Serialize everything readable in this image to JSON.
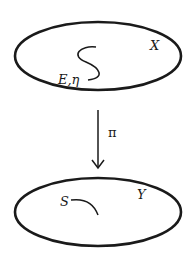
{
  "diagram": {
    "top_space": {
      "label": "X",
      "curve_label": "E,η"
    },
    "map": {
      "label": "π",
      "direction": "down"
    },
    "bottom_space": {
      "label": "Y",
      "curve_label": "S"
    }
  },
  "colors": {
    "stroke": "#1a1a1a",
    "background": "#ffffff"
  }
}
